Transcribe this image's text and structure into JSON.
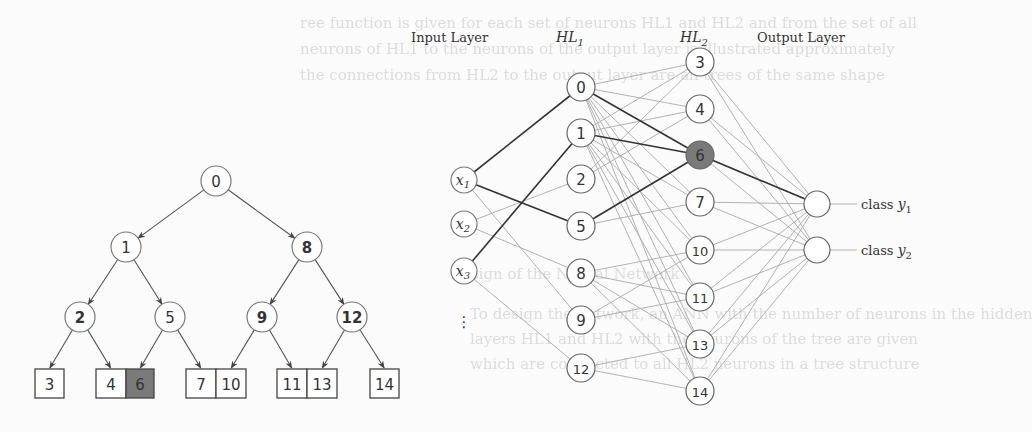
{
  "background_bleed_lines": [
    {
      "text": "ree function is given for each set of neurons HL1 and HL2 and from the set of all",
      "x": 300,
      "y": 14
    },
    {
      "text": "neurons of HL1 to the neurons of the output layer is illustrated approximately",
      "x": 300,
      "y": 40
    },
    {
      "text": "the connections from HL2 to the output layer are all trees of the same shape",
      "x": 300,
      "y": 66
    },
    {
      "text": "Design of the Neural Network",
      "x": 450,
      "y": 265
    },
    {
      "text": "To design the network, an ANN with the number of neurons in the hidden",
      "x": 470,
      "y": 305
    },
    {
      "text": "layers HL1 and HL2 with the neurons of the tree are given",
      "x": 470,
      "y": 330
    },
    {
      "text": "which are connected to all HL2 neurons in a tree structure",
      "x": 470,
      "y": 355
    }
  ],
  "tree": {
    "internal_nodes": [
      {
        "id": "0",
        "x": 216,
        "y": 181,
        "bold": false
      },
      {
        "id": "1",
        "x": 126,
        "y": 247,
        "bold": false
      },
      {
        "id": "8",
        "x": 307,
        "y": 247,
        "bold": true
      },
      {
        "id": "2",
        "x": 80,
        "y": 317,
        "bold": true
      },
      {
        "id": "5",
        "x": 170,
        "y": 317,
        "bold": false
      },
      {
        "id": "9",
        "x": 262,
        "y": 317,
        "bold": true
      },
      {
        "id": "12",
        "x": 352,
        "y": 317,
        "bold": true
      }
    ],
    "leaves": [
      {
        "id": "3",
        "x": 35,
        "w": 29,
        "highlight": false
      },
      {
        "id": "4",
        "x": 96,
        "w": 30,
        "highlight": false
      },
      {
        "id": "6",
        "x": 126,
        "w": 28,
        "highlight": true
      },
      {
        "id": "7",
        "x": 186,
        "w": 30,
        "highlight": false
      },
      {
        "id": "10",
        "x": 216,
        "w": 30,
        "highlight": false
      },
      {
        "id": "11",
        "x": 277,
        "w": 30,
        "highlight": false
      },
      {
        "id": "13",
        "x": 307,
        "w": 30,
        "highlight": false
      },
      {
        "id": "14",
        "x": 370,
        "w": 29,
        "highlight": false
      }
    ],
    "leaf_y": 369,
    "leaf_h": 29,
    "edges": [
      [
        "0",
        "1"
      ],
      [
        "0",
        "8"
      ],
      [
        "1",
        "2"
      ],
      [
        "1",
        "5"
      ],
      [
        "8",
        "9"
      ],
      [
        "8",
        "12"
      ],
      [
        "2",
        "L3"
      ],
      [
        "2",
        "L4"
      ],
      [
        "5",
        "L6"
      ],
      [
        "5",
        "L7"
      ],
      [
        "9",
        "L10"
      ],
      [
        "9",
        "L11"
      ],
      [
        "12",
        "L13"
      ],
      [
        "12",
        "L14"
      ]
    ],
    "highlight_color": "#7a7a7a"
  },
  "network": {
    "layer_labels": {
      "input": "Input Layer",
      "hl1_main": "HL",
      "hl1_sub": "1",
      "hl2_main": "HL",
      "hl2_sub": "2",
      "output": "Output Layer"
    },
    "input_nodes": [
      {
        "id": "x1",
        "main": "x",
        "sub": "1",
        "x": 464,
        "y": 180
      },
      {
        "id": "x2",
        "main": "x",
        "sub": "2",
        "x": 464,
        "y": 224
      },
      {
        "id": "x3",
        "main": "x",
        "sub": "3",
        "x": 464,
        "y": 271
      }
    ],
    "input_ellipsis": "⋮",
    "hl1_nodes": [
      {
        "id": "0",
        "x": 581,
        "y": 87
      },
      {
        "id": "1",
        "x": 581,
        "y": 133
      },
      {
        "id": "2",
        "x": 581,
        "y": 179
      },
      {
        "id": "5",
        "x": 581,
        "y": 226
      },
      {
        "id": "8",
        "x": 581,
        "y": 273
      },
      {
        "id": "9",
        "x": 581,
        "y": 320
      },
      {
        "id": "12",
        "x": 581,
        "y": 368
      }
    ],
    "hl2_nodes": [
      {
        "id": "3",
        "x": 700,
        "y": 62,
        "highlight": false
      },
      {
        "id": "4",
        "x": 700,
        "y": 109,
        "highlight": false
      },
      {
        "id": "6",
        "x": 700,
        "y": 155,
        "highlight": true
      },
      {
        "id": "7",
        "x": 700,
        "y": 202,
        "highlight": false
      },
      {
        "id": "10",
        "x": 700,
        "y": 250,
        "highlight": false
      },
      {
        "id": "11",
        "x": 700,
        "y": 297,
        "highlight": false
      },
      {
        "id": "13",
        "x": 700,
        "y": 344,
        "highlight": false
      },
      {
        "id": "14",
        "x": 700,
        "y": 391,
        "highlight": false
      }
    ],
    "output_nodes": [
      {
        "id": "y1",
        "label_main": "class ",
        "label_var": "y",
        "label_sub": "1",
        "x": 817,
        "y": 204
      },
      {
        "id": "y2",
        "label_main": "class ",
        "label_var": "y",
        "label_sub": "2",
        "x": 817,
        "y": 250
      }
    ],
    "bold_edges_in_hl1": [
      [
        "x1",
        "0"
      ],
      [
        "x1",
        "5"
      ],
      [
        "x3",
        "1"
      ]
    ],
    "thin_edges_in_hl1": [
      [
        "x1",
        "9"
      ],
      [
        "x2",
        "2"
      ],
      [
        "x2",
        "8"
      ],
      [
        "x3",
        "12"
      ]
    ],
    "bold_edges_hl1_hl2": [
      [
        "0",
        "6"
      ],
      [
        "1",
        "6"
      ],
      [
        "5",
        "6"
      ]
    ],
    "hl1_hl2_edges": {
      "0": [
        "3",
        "4",
        "7",
        "10",
        "11",
        "13",
        "14"
      ],
      "1": [
        "3",
        "4",
        "7",
        "10",
        "11",
        "13",
        "14"
      ],
      "2": [
        "3",
        "4"
      ],
      "5": [
        "7"
      ],
      "8": [
        "10",
        "11",
        "13",
        "14"
      ],
      "9": [
        "10",
        "11"
      ],
      "12": [
        "13",
        "14"
      ]
    },
    "bold_edges_hl2_out": [
      [
        "6",
        "y1"
      ]
    ],
    "highlight_color": "#7a7a7a"
  }
}
